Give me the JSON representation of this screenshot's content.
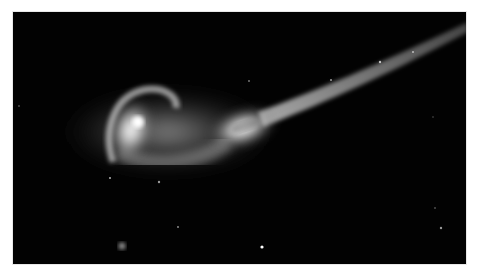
{
  "image": {
    "subject": "interacting-galaxies",
    "description": "Two interacting galaxies with a long tidal tail against a black starfield",
    "colors": {
      "background": "#ffffff",
      "sky": "#020202",
      "glow": "#ffffff"
    }
  }
}
